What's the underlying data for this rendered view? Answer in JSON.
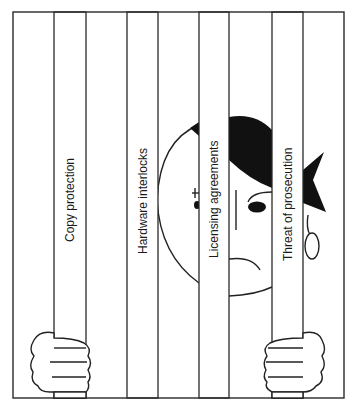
{
  "illustration": {
    "subject": "cartoon person behind prison bars",
    "bars": [
      {
        "label": "Copy protection"
      },
      {
        "label": "Hardware interlocks"
      },
      {
        "label": "Licensing agreements"
      },
      {
        "label": "Threat of prosecution"
      }
    ],
    "colors": {
      "line": "#2a2a2a",
      "fill_dark": "#111111",
      "background": "#ffffff"
    }
  }
}
